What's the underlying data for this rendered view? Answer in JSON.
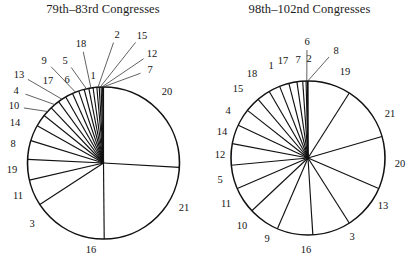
{
  "figure": {
    "background_color": "#ffffff",
    "line_color": "#111111",
    "text_color": "#141414",
    "width": 413,
    "height": 259
  },
  "panels": [
    {
      "id": "left",
      "title": "79th–83rd Congresses"
    },
    {
      "id": "right",
      "title": "98th–102nd Congresses"
    }
  ],
  "chart_data": [
    {
      "type": "pie",
      "title": "79th–83rd Congresses",
      "start_angle_deg": 90,
      "direction": "clockwise",
      "legend": "none",
      "grid": false,
      "units": "share of total (unitless proportions)",
      "categories": [
        "20",
        "21",
        "16",
        "3",
        "11",
        "19",
        "8",
        "14",
        "10",
        "4",
        "13",
        "17",
        "9",
        "6",
        "5",
        "18",
        "1",
        "2",
        "15",
        "12",
        "7"
      ],
      "labels": [
        "20",
        "21",
        "16",
        "3",
        "11",
        "19",
        "8",
        "14",
        "10",
        "4",
        "13",
        "17",
        "9",
        "6",
        "5",
        "18",
        "1",
        "2",
        "15",
        "12",
        "7"
      ],
      "values": [
        26.0,
        24.0,
        16.0,
        5.6,
        4.4,
        4.0,
        3.4,
        2.6,
        2.2,
        2.0,
        1.8,
        1.6,
        1.4,
        1.2,
        1.0,
        0.9,
        0.8,
        0.5,
        0.4,
        0.3,
        0.2
      ],
      "value_unit": "percent"
    },
    {
      "type": "pie",
      "title": "98th–102nd Congresses",
      "start_angle_deg": 90,
      "direction": "clockwise",
      "legend": "none",
      "grid": false,
      "units": "share of total (unitless proportions)",
      "categories": [
        "19",
        "21",
        "20",
        "13",
        "3",
        "16",
        "9",
        "10",
        "11",
        "5",
        "12",
        "14",
        "4",
        "15",
        "18",
        "1",
        "17",
        "7",
        "2",
        "6",
        "8"
      ],
      "labels": [
        "19",
        "21",
        "20",
        "13",
        "3",
        "16",
        "9",
        "10",
        "11",
        "5",
        "12",
        "14",
        "4",
        "15",
        "18",
        "1",
        "17",
        "7",
        "2",
        "6",
        "8"
      ],
      "values": [
        9.0,
        11.5,
        11.0,
        9.5,
        8.0,
        7.5,
        6.5,
        5.5,
        5.0,
        4.5,
        4.0,
        3.6,
        3.2,
        2.8,
        2.4,
        2.0,
        1.7,
        1.2,
        0.7,
        0.3,
        0.1
      ],
      "value_unit": "percent"
    }
  ],
  "left_chart": {
    "title": "79th–83rd Congresses",
    "slice_labels": [
      {
        "text": "20",
        "x": 167,
        "y": 93,
        "leader": false
      },
      {
        "text": "21",
        "x": 184,
        "y": 209,
        "leader": false
      },
      {
        "text": "16",
        "x": 91,
        "y": 251,
        "leader": false
      },
      {
        "text": "3",
        "x": 32,
        "y": 225,
        "leader": false
      },
      {
        "text": "11",
        "x": 18,
        "y": 197,
        "leader": false
      },
      {
        "text": "19",
        "x": 12,
        "y": 171,
        "leader": false
      },
      {
        "text": "8",
        "x": 13,
        "y": 145,
        "leader": false
      },
      {
        "text": "14",
        "x": 15,
        "y": 124,
        "leader": false
      },
      {
        "text": "10",
        "x": 14,
        "y": 107,
        "leader": true
      },
      {
        "text": "4",
        "x": 16,
        "y": 92,
        "leader": true
      },
      {
        "text": "13",
        "x": 19,
        "y": 76,
        "leader": true
      },
      {
        "text": "17",
        "x": 48,
        "y": 82,
        "leader": false
      },
      {
        "text": "9",
        "x": 44,
        "y": 62,
        "leader": true
      },
      {
        "text": "6",
        "x": 67,
        "y": 81,
        "leader": false
      },
      {
        "text": "5",
        "x": 65,
        "y": 62,
        "leader": true
      },
      {
        "text": "18",
        "x": 81,
        "y": 45,
        "leader": true
      },
      {
        "text": "1",
        "x": 93,
        "y": 77,
        "leader": false
      },
      {
        "text": "2",
        "x": 117,
        "y": 36,
        "leader": true
      },
      {
        "text": "15",
        "x": 142,
        "y": 37,
        "leader": true
      },
      {
        "text": "12",
        "x": 152,
        "y": 55,
        "leader": true
      },
      {
        "text": "7",
        "x": 150,
        "y": 71,
        "leader": true
      }
    ]
  },
  "right_chart": {
    "title": "98th–102nd Congresses",
    "slice_labels": [
      {
        "text": "19",
        "x": 345,
        "y": 73,
        "leader": false
      },
      {
        "text": "21",
        "x": 390,
        "y": 115,
        "leader": false
      },
      {
        "text": "20",
        "x": 400,
        "y": 165,
        "leader": false
      },
      {
        "text": "13",
        "x": 383,
        "y": 207,
        "leader": false
      },
      {
        "text": "3",
        "x": 352,
        "y": 238,
        "leader": false
      },
      {
        "text": "16",
        "x": 306,
        "y": 251,
        "leader": false
      },
      {
        "text": "9",
        "x": 267,
        "y": 240,
        "leader": false
      },
      {
        "text": "10",
        "x": 242,
        "y": 227,
        "leader": false
      },
      {
        "text": "11",
        "x": 226,
        "y": 205,
        "leader": false
      },
      {
        "text": "5",
        "x": 220,
        "y": 181,
        "leader": false
      },
      {
        "text": "12",
        "x": 220,
        "y": 156,
        "leader": false
      },
      {
        "text": "14",
        "x": 222,
        "y": 133,
        "leader": false
      },
      {
        "text": "4",
        "x": 228,
        "y": 112,
        "leader": false
      },
      {
        "text": "15",
        "x": 238,
        "y": 90,
        "leader": false
      },
      {
        "text": "18",
        "x": 252,
        "y": 75,
        "leader": false
      },
      {
        "text": "1",
        "x": 271,
        "y": 67,
        "leader": false
      },
      {
        "text": "17",
        "x": 283,
        "y": 62,
        "leader": false
      },
      {
        "text": "7",
        "x": 298,
        "y": 61,
        "leader": false
      },
      {
        "text": "2",
        "x": 309,
        "y": 60,
        "leader": false
      },
      {
        "text": "6",
        "x": 307,
        "y": 43,
        "leader": true
      },
      {
        "text": "8",
        "x": 336,
        "y": 52,
        "leader": true
      }
    ]
  }
}
